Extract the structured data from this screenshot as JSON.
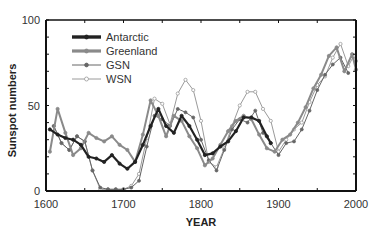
{
  "chart_data": {
    "type": "line",
    "title": "",
    "xlabel": "YEAR",
    "ylabel": "Sunspot numbers",
    "xlim": [
      1600,
      2000
    ],
    "ylim": [
      0,
      100
    ],
    "x_ticks": [
      "1600",
      "1700",
      "1800",
      "1900",
      "2000"
    ],
    "y_ticks": [
      "0",
      "50",
      "100"
    ],
    "grid": false,
    "legend_position": "upper-left",
    "series": [
      {
        "name": "Antarctic",
        "style": "thick-black",
        "color": "#222222",
        "points": [
          [
            1605,
            36
          ],
          [
            1615,
            33
          ],
          [
            1625,
            31
          ],
          [
            1635,
            30
          ],
          [
            1645,
            27
          ],
          [
            1655,
            20
          ],
          [
            1665,
            19
          ],
          [
            1675,
            17
          ],
          [
            1685,
            21
          ],
          [
            1695,
            16
          ],
          [
            1705,
            13
          ],
          [
            1715,
            17
          ],
          [
            1725,
            27
          ],
          [
            1735,
            38
          ],
          [
            1745,
            48
          ],
          [
            1755,
            38
          ],
          [
            1765,
            34
          ],
          [
            1775,
            44
          ],
          [
            1785,
            38
          ],
          [
            1795,
            30
          ],
          [
            1805,
            21
          ],
          [
            1815,
            22
          ],
          [
            1825,
            26
          ],
          [
            1835,
            29
          ],
          [
            1845,
            35
          ],
          [
            1855,
            43
          ],
          [
            1865,
            43
          ],
          [
            1875,
            41
          ],
          [
            1885,
            32
          ],
          [
            1890,
            28
          ]
        ]
      },
      {
        "name": "Greenland",
        "style": "thick-gray",
        "color": "#8a8a8a",
        "points": [
          [
            1605,
            23
          ],
          [
            1615,
            48
          ],
          [
            1625,
            34
          ],
          [
            1635,
            21
          ],
          [
            1645,
            25
          ],
          [
            1655,
            34
          ],
          [
            1665,
            31
          ],
          [
            1675,
            29
          ],
          [
            1685,
            32
          ],
          [
            1695,
            27
          ],
          [
            1705,
            24
          ],
          [
            1715,
            17
          ],
          [
            1725,
            33
          ],
          [
            1735,
            53
          ],
          [
            1745,
            44
          ],
          [
            1755,
            32
          ],
          [
            1765,
            44
          ],
          [
            1775,
            41
          ],
          [
            1785,
            32
          ],
          [
            1795,
            25
          ],
          [
            1805,
            15
          ],
          [
            1815,
            19
          ],
          [
            1825,
            27
          ],
          [
            1835,
            35
          ],
          [
            1845,
            41
          ],
          [
            1855,
            44
          ],
          [
            1865,
            42
          ],
          [
            1875,
            33
          ],
          [
            1885,
            25
          ],
          [
            1895,
            23
          ],
          [
            1905,
            30
          ],
          [
            1915,
            33
          ],
          [
            1925,
            40
          ],
          [
            1935,
            49
          ],
          [
            1945,
            60
          ],
          [
            1955,
            68
          ],
          [
            1965,
            79
          ],
          [
            1975,
            84
          ],
          [
            1985,
            70
          ],
          [
            1995,
            80
          ],
          [
            2000,
            71
          ]
        ]
      },
      {
        "name": "GSN",
        "style": "thin-gray-filled",
        "color": "#555555",
        "points": [
          [
            1610,
            38
          ],
          [
            1620,
            28
          ],
          [
            1630,
            24
          ],
          [
            1640,
            32
          ],
          [
            1650,
            29
          ],
          [
            1660,
            12
          ],
          [
            1670,
            2
          ],
          [
            1680,
            1
          ],
          [
            1690,
            1
          ],
          [
            1700,
            1
          ],
          [
            1710,
            2
          ],
          [
            1720,
            6
          ],
          [
            1730,
            26
          ],
          [
            1740,
            44
          ],
          [
            1750,
            42
          ],
          [
            1760,
            38
          ],
          [
            1770,
            48
          ],
          [
            1780,
            46
          ],
          [
            1790,
            43
          ],
          [
            1800,
            30
          ],
          [
            1810,
            18
          ],
          [
            1820,
            12
          ],
          [
            1830,
            24
          ],
          [
            1840,
            36
          ],
          [
            1850,
            42
          ],
          [
            1860,
            40
          ],
          [
            1870,
            47
          ],
          [
            1880,
            34
          ],
          [
            1890,
            28
          ],
          [
            1900,
            21
          ],
          [
            1910,
            28
          ],
          [
            1920,
            29
          ],
          [
            1930,
            36
          ],
          [
            1940,
            47
          ],
          [
            1950,
            59
          ],
          [
            1960,
            68
          ],
          [
            1970,
            74
          ],
          [
            1980,
            78
          ],
          [
            1990,
            69
          ]
        ]
      },
      {
        "name": "WSN",
        "style": "thin-gray-open",
        "color": "#999999",
        "points": [
          [
            1610,
            38
          ],
          [
            1620,
            28
          ],
          [
            1630,
            24
          ],
          [
            1640,
            32
          ],
          [
            1650,
            29
          ],
          [
            1660,
            12
          ],
          [
            1670,
            1
          ],
          [
            1680,
            1
          ],
          [
            1690,
            1
          ],
          [
            1700,
            1
          ],
          [
            1710,
            3
          ],
          [
            1720,
            10
          ],
          [
            1730,
            31
          ],
          [
            1740,
            54
          ],
          [
            1750,
            51
          ],
          [
            1760,
            39
          ],
          [
            1770,
            57
          ],
          [
            1780,
            65
          ],
          [
            1790,
            59
          ],
          [
            1800,
            41
          ],
          [
            1810,
            17
          ],
          [
            1820,
            14
          ],
          [
            1830,
            25
          ],
          [
            1840,
            38
          ],
          [
            1850,
            50
          ],
          [
            1860,
            58
          ],
          [
            1870,
            58
          ],
          [
            1880,
            48
          ],
          [
            1890,
            41
          ],
          [
            1900,
            23
          ],
          [
            1910,
            30
          ],
          [
            1920,
            36
          ],
          [
            1930,
            40
          ],
          [
            1940,
            52
          ],
          [
            1950,
            62
          ],
          [
            1960,
            67
          ],
          [
            1970,
            78
          ],
          [
            1980,
            86
          ],
          [
            1990,
            73
          ],
          [
            1997,
            79
          ],
          [
            2000,
            76
          ]
        ]
      }
    ]
  },
  "legend": {
    "items": [
      {
        "label": "Antarctic"
      },
      {
        "label": "Greenland"
      },
      {
        "label": "GSN"
      },
      {
        "label": "WSN"
      }
    ]
  }
}
